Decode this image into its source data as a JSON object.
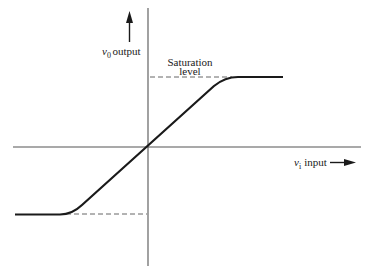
{
  "diagram": {
    "type": "transfer-characteristic",
    "y_axis": {
      "symbol": "v",
      "subscript": "0",
      "label": "output"
    },
    "x_axis": {
      "symbol": "v",
      "subscript": "i",
      "label": "input"
    },
    "annotation": {
      "line1": "Saturation",
      "line2": "level"
    },
    "colors": {
      "axis": "#555555",
      "curve": "#1a1a1a",
      "dashed": "#666666",
      "text": "#1a1a1a"
    }
  }
}
